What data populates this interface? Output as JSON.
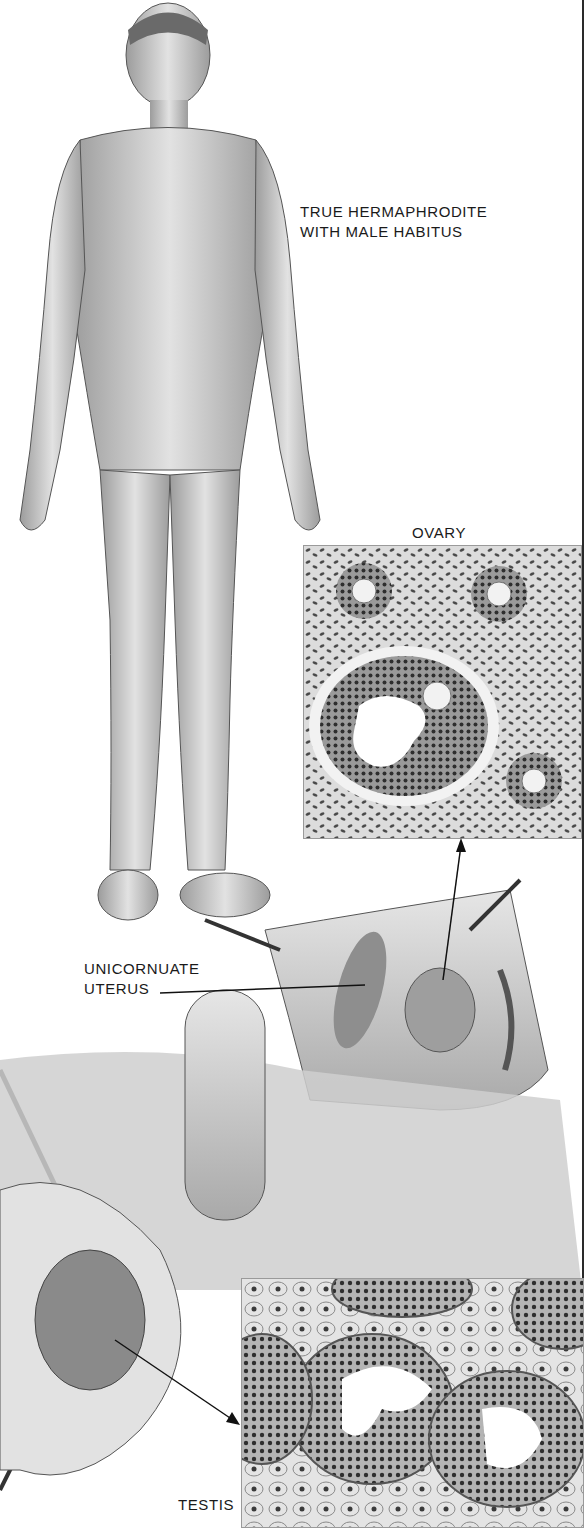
{
  "illustration": {
    "style": "grayscale medical illustration",
    "colors": {
      "ink": "#1a1a1a",
      "tissue_light": "#d9d9d9",
      "tissue_mid": "#a8a8a8",
      "nuclei": "#3a3a3a",
      "skin": "#c8c8c8",
      "border": "#2a2a2a"
    }
  },
  "labels": {
    "main_title_line1": "TRUE HERMAPHRODITE",
    "main_title_line2": "WITH MALE HABITUS",
    "ovary": "OVARY",
    "uterus_line1": "UNICORNUATE",
    "uterus_line2": "UTERUS",
    "testis": "TESTIS"
  },
  "panels": [
    {
      "name": "full-body-figure",
      "description": "standing figure, frontal view"
    },
    {
      "name": "ovary-histology",
      "description": "ovarian tissue section with follicles"
    },
    {
      "name": "surgical-view",
      "description": "operative view showing internal structures"
    },
    {
      "name": "testis-histology",
      "description": "seminiferous tubules section"
    }
  ]
}
